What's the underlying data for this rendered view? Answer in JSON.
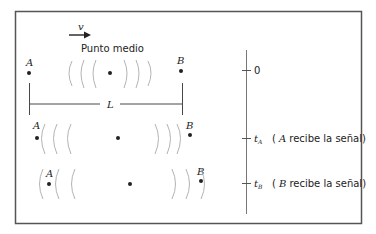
{
  "diagram": {
    "velocity_label": "v",
    "midpoint_label": "Punto medio",
    "point_a": "A",
    "point_b": "B",
    "length_label": "L",
    "timeline": {
      "tick0": "0",
      "tickA_symbol": "t",
      "tickA_sub": "A",
      "tickA_note_open": "(",
      "tickA_note_letter": "A",
      "tickA_note_text": " recibe la señal",
      "tickA_note_close": ")",
      "tickB_symbol": "t",
      "tickB_sub": "B",
      "tickB_note_open": "(",
      "tickB_note_letter": "B",
      "tickB_note_text": " recibe la señal",
      "tickB_note_close": ")"
    },
    "colors": {
      "frame": "#555555",
      "ink": "#222222",
      "wave": "#aaaaaa"
    }
  }
}
